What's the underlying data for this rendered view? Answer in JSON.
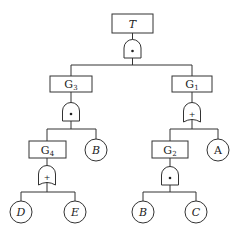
{
  "diagram": {
    "type": "fault-tree",
    "top_event": {
      "label": "T"
    },
    "gates": [
      {
        "id": "g_top",
        "type": "AND",
        "symbol": "•",
        "output": "T",
        "inputs": [
          "G3",
          "G1"
        ]
      },
      {
        "id": "g_g3",
        "type": "AND",
        "symbol": "•",
        "output": "G3",
        "inputs": [
          "G4",
          "B"
        ]
      },
      {
        "id": "g_g1",
        "type": "OR",
        "symbol": "+",
        "output": "G1",
        "inputs": [
          "G2",
          "A"
        ]
      },
      {
        "id": "g_g4",
        "type": "OR",
        "symbol": "+",
        "output": "G4",
        "inputs": [
          "D",
          "E"
        ]
      },
      {
        "id": "g_g2",
        "type": "AND",
        "symbol": "•",
        "output": "G2",
        "inputs": [
          "B",
          "C"
        ]
      }
    ],
    "intermediate_events": [
      {
        "id": "G3",
        "base": "G",
        "sub": "3"
      },
      {
        "id": "G1",
        "base": "G",
        "sub": "1"
      },
      {
        "id": "G4",
        "base": "G",
        "sub": "4"
      },
      {
        "id": "G2",
        "base": "G",
        "sub": "2"
      }
    ],
    "basic_events": [
      {
        "id": "B_left",
        "label": "B"
      },
      {
        "id": "A",
        "label": "A"
      },
      {
        "id": "D",
        "label": "D"
      },
      {
        "id": "E",
        "label": "E"
      },
      {
        "id": "B_right",
        "label": "B"
      },
      {
        "id": "C",
        "label": "C"
      }
    ]
  }
}
